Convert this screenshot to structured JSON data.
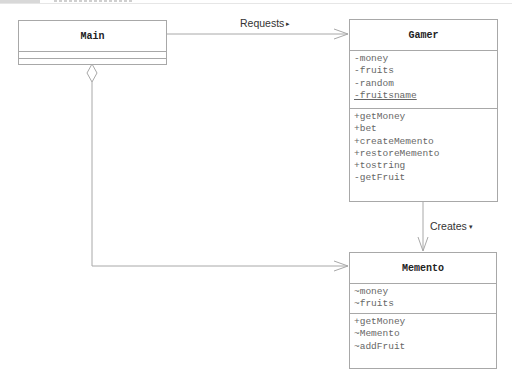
{
  "diagram": {
    "type": "uml-class-diagram",
    "classes": {
      "main": {
        "name": "Main",
        "attributes": [],
        "operations": []
      },
      "gamer": {
        "name": "Gamer",
        "attributes": [
          "-money",
          "-fruits",
          "-random",
          "-fruitsname"
        ],
        "static_attributes": [
          "-fruitsname"
        ],
        "operations": [
          "+getMoney",
          "+bet",
          "+createMemento",
          "+restoreMemento",
          "+tostring",
          "-getFruit"
        ]
      },
      "memento": {
        "name": "Memento",
        "attributes": [
          "~money",
          "~fruits"
        ],
        "operations": [
          "+getMoney",
          "~Memento",
          "~addFruit"
        ]
      }
    },
    "relationships": [
      {
        "from": "Main",
        "to": "Gamer",
        "kind": "association",
        "label": "Requests",
        "direction_glyph": "▸"
      },
      {
        "from": "Gamer",
        "to": "Memento",
        "kind": "dependency",
        "label": "Creates",
        "direction_glyph": "▾"
      },
      {
        "from": "Main",
        "to": "Memento",
        "kind": "aggregation",
        "label": ""
      }
    ]
  },
  "colors": {
    "line": "#a8a8a8",
    "text": "#222222",
    "member_text": "#666666",
    "background": "#ffffff"
  }
}
